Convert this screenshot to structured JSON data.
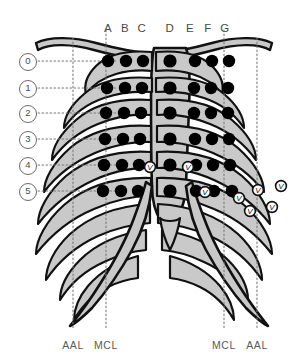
{
  "figure": {
    "kind": "thoracic-rib-cage-electrode-grid",
    "background_color": "#ffffff",
    "rib_fill": "#c9c9c9",
    "outline_color": "#111111",
    "electrode_color": "#000000",
    "guide_line_color": "#7a7a7a",
    "label_color": "#4a4a4a"
  },
  "column_labels": [
    {
      "text": "A",
      "x": 108
    },
    {
      "text": "B",
      "x": 125
    },
    {
      "text": "C",
      "x": 142
    },
    {
      "text": "D",
      "x": 170
    },
    {
      "text": "E",
      "x": 190
    },
    {
      "text": "F",
      "x": 208
    },
    {
      "text": "G",
      "x": 225
    }
  ],
  "column_labels_y": 22,
  "row_labels": [
    {
      "text": "0",
      "y": 61
    },
    {
      "text": "1",
      "y": 88
    },
    {
      "text": "2",
      "y": 113
    },
    {
      "text": "3",
      "y": 139
    },
    {
      "text": "4",
      "y": 165
    },
    {
      "text": "5",
      "y": 191
    }
  ],
  "row_labels_x": 27,
  "axis_labels": [
    {
      "text": "AAL",
      "x": 73,
      "y": 339
    },
    {
      "text": "MCL",
      "x": 106,
      "y": 339
    },
    {
      "text": "MCL",
      "x": 224,
      "y": 339
    },
    {
      "text": "AAL",
      "x": 257,
      "y": 339
    }
  ],
  "vertical_guides": [
    {
      "name": "aal-left",
      "x": 73,
      "y1": 38,
      "y2": 330
    },
    {
      "name": "mcl-left",
      "x": 106,
      "y1": 30,
      "y2": 330
    },
    {
      "name": "mcl-right",
      "x": 224,
      "y1": 30,
      "y2": 330
    },
    {
      "name": "aal-right",
      "x": 257,
      "y1": 38,
      "y2": 330
    }
  ],
  "horizontal_guides": [
    {
      "row": "0",
      "y": 61,
      "x1": 38,
      "x2": 118
    },
    {
      "row": "1",
      "y": 88,
      "x1": 38,
      "x2": 118
    },
    {
      "row": "2",
      "y": 113,
      "x1": 38,
      "x2": 118
    },
    {
      "row": "3",
      "y": 139,
      "x1": 38,
      "x2": 118
    },
    {
      "row": "4",
      "y": 165,
      "x1": 38,
      "x2": 118
    },
    {
      "row": "5",
      "y": 191,
      "x1": 38,
      "x2": 118
    }
  ],
  "electrodes": [
    {
      "row": "0",
      "col": "A",
      "x": 108,
      "y": 61,
      "r": 6.2
    },
    {
      "row": "0",
      "col": "B",
      "x": 126,
      "y": 61,
      "r": 6.2
    },
    {
      "row": "0",
      "col": "C",
      "x": 143,
      "y": 61,
      "r": 6.2
    },
    {
      "row": "0",
      "col": "D",
      "x": 170,
      "y": 61,
      "r": 6.6
    },
    {
      "row": "0",
      "col": "E",
      "x": 195,
      "y": 61,
      "r": 6.2
    },
    {
      "row": "0",
      "col": "F",
      "x": 212,
      "y": 61,
      "r": 6.2
    },
    {
      "row": "0",
      "col": "G",
      "x": 229,
      "y": 61,
      "r": 6.2
    },
    {
      "row": "1",
      "col": "A",
      "x": 107,
      "y": 88,
      "r": 6.2
    },
    {
      "row": "1",
      "col": "B",
      "x": 125,
      "y": 88,
      "r": 6.2
    },
    {
      "row": "1",
      "col": "C",
      "x": 142,
      "y": 88,
      "r": 6.2
    },
    {
      "row": "1",
      "col": "D",
      "x": 170,
      "y": 88,
      "r": 6.6
    },
    {
      "row": "1",
      "col": "E",
      "x": 194,
      "y": 88,
      "r": 6.2
    },
    {
      "row": "1",
      "col": "F",
      "x": 211,
      "y": 88,
      "r": 6.2
    },
    {
      "row": "1",
      "col": "G",
      "x": 228,
      "y": 88,
      "r": 6.2
    },
    {
      "row": "2",
      "col": "A",
      "x": 106,
      "y": 113,
      "r": 6.2
    },
    {
      "row": "2",
      "col": "B",
      "x": 124,
      "y": 113,
      "r": 6.2
    },
    {
      "row": "2",
      "col": "C",
      "x": 141,
      "y": 113,
      "r": 6.2
    },
    {
      "row": "2",
      "col": "D",
      "x": 170,
      "y": 113,
      "r": 6.6
    },
    {
      "row": "2",
      "col": "E",
      "x": 194,
      "y": 113,
      "r": 6.2
    },
    {
      "row": "2",
      "col": "F",
      "x": 211,
      "y": 113,
      "r": 6.2
    },
    {
      "row": "2",
      "col": "G",
      "x": 228,
      "y": 113,
      "r": 6.2
    },
    {
      "row": "3",
      "col": "A",
      "x": 105,
      "y": 139,
      "r": 6.2
    },
    {
      "row": "3",
      "col": "B",
      "x": 123,
      "y": 139,
      "r": 6.2
    },
    {
      "row": "3",
      "col": "C",
      "x": 140,
      "y": 139,
      "r": 6.2
    },
    {
      "row": "3",
      "col": "D",
      "x": 170,
      "y": 139,
      "r": 6.6
    },
    {
      "row": "3",
      "col": "E",
      "x": 195,
      "y": 139,
      "r": 6.2
    },
    {
      "row": "3",
      "col": "F",
      "x": 212,
      "y": 139,
      "r": 6.2
    },
    {
      "row": "3",
      "col": "G",
      "x": 229,
      "y": 139,
      "r": 6.2
    },
    {
      "row": "4",
      "col": "A",
      "x": 104,
      "y": 165,
      "r": 6.2
    },
    {
      "row": "4",
      "col": "B",
      "x": 122,
      "y": 165,
      "r": 6.2
    },
    {
      "row": "4",
      "col": "C",
      "x": 139,
      "y": 165,
      "r": 6.2
    },
    {
      "row": "4",
      "col": "D",
      "x": 170,
      "y": 165,
      "r": 6.6
    },
    {
      "row": "4",
      "col": "E",
      "x": 196,
      "y": 165,
      "r": 6.2
    },
    {
      "row": "4",
      "col": "F",
      "x": 213,
      "y": 165,
      "r": 6.2
    },
    {
      "row": "4",
      "col": "G",
      "x": 230,
      "y": 165,
      "r": 6.2
    },
    {
      "row": "5",
      "col": "A",
      "x": 103,
      "y": 191,
      "r": 6.2
    },
    {
      "row": "5",
      "col": "B",
      "x": 121,
      "y": 191,
      "r": 6.2
    },
    {
      "row": "5",
      "col": "C",
      "x": 138,
      "y": 191,
      "r": 6.2
    },
    {
      "row": "5",
      "col": "D",
      "x": 170,
      "y": 191,
      "r": 6.6
    },
    {
      "row": "5",
      "col": "E",
      "x": 196,
      "y": 191,
      "r": 6.2
    },
    {
      "row": "5",
      "col": "F",
      "x": 214,
      "y": 191,
      "r": 6.2
    },
    {
      "row": "5",
      "col": "G",
      "x": 232,
      "y": 191,
      "r": 6.2
    }
  ],
  "v_markers": [
    {
      "label": "V",
      "x": 150,
      "y": 167
    },
    {
      "label": "V",
      "x": 188,
      "y": 167
    },
    {
      "label": "V",
      "x": 205,
      "y": 192
    },
    {
      "label": "V",
      "x": 239,
      "y": 198
    },
    {
      "label": "V",
      "x": 258,
      "y": 190
    },
    {
      "label": "V",
      "x": 281,
      "y": 186
    },
    {
      "label": "V",
      "x": 250,
      "y": 211
    },
    {
      "label": "V",
      "x": 272,
      "y": 207
    }
  ]
}
